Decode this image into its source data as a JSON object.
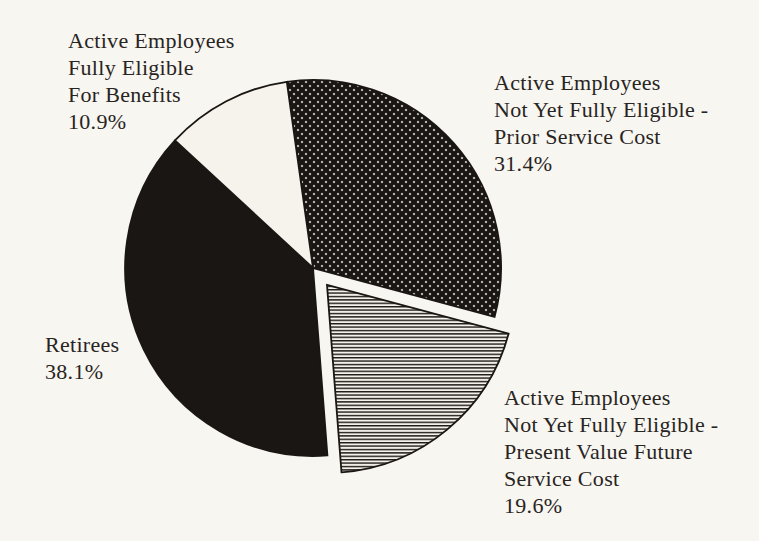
{
  "chart_data": {
    "type": "pie",
    "title": "",
    "legend_position": "none",
    "labels_layout": "outside-text-blocks",
    "start_angle_deg": -8,
    "clockwise": true,
    "slices": [
      {
        "id": "prior_service",
        "label": "Active Employees Not Yet Fully Eligible - Prior Service Cost",
        "pct": 31.4,
        "fill": "crosshatch",
        "exploded": false
      },
      {
        "id": "present_value",
        "label": "Active Employees Not Yet Fully Eligible - Present Value Future Service Cost",
        "pct": 19.6,
        "fill": "hlines",
        "exploded": true
      },
      {
        "id": "retirees",
        "label": "Retirees",
        "pct": 38.1,
        "fill": "black",
        "exploded": false
      },
      {
        "id": "fully_eligible",
        "label": "Active Employees Fully Eligible For Benefits",
        "pct": 10.9,
        "fill": "white",
        "exploded": false
      }
    ]
  },
  "labels": {
    "fully_eligible": {
      "lines": [
        "Active Employees",
        "Fully Eligible",
        "For Benefits",
        "10.9%"
      ]
    },
    "prior_service": {
      "lines": [
        "Active Employees",
        "Not Yet Fully Eligible -",
        "Prior Service Cost",
        "31.4%"
      ]
    },
    "retirees": {
      "lines": [
        "Retirees",
        "38.1%"
      ]
    },
    "present_value": {
      "lines": [
        "Active Employees",
        "Not Yet Fully Eligible -",
        "Present Value Future",
        "Service Cost",
        "19.6%"
      ]
    }
  },
  "colors": {
    "ink": "#1a1613",
    "paper": "#f8f6f0",
    "pattern_bg": "#f3f1ea",
    "slice_white": "#f5f3ec"
  },
  "pie_layout": {
    "cx": 313,
    "cy": 268,
    "r": 188,
    "explode_offset": 22,
    "stroke_width": 1.8
  }
}
